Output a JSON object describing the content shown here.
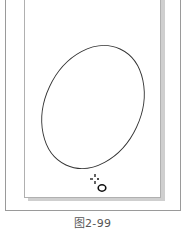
{
  "caption": "图2-99",
  "canvas": {
    "shape": "ellipse",
    "stroke_color": "#333333"
  },
  "cursor": {
    "icon": "ellipse-tool-cursor-icon"
  }
}
